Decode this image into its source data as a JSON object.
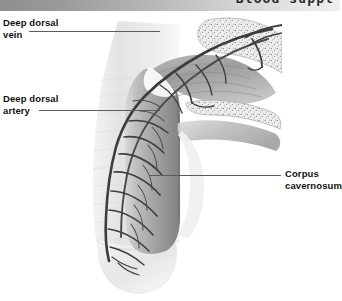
{
  "header": {
    "title": "Blood suppl",
    "bar_gradient_from": "#8e8e8e",
    "bar_gradient_to": "#efefef"
  },
  "figure": {
    "ink_color": "#3a3a3a",
    "tissue_light": "#e9e9e9",
    "tissue_mid": "#c9c9c9",
    "tissue_dark": "#9a9a9a"
  },
  "labels": [
    {
      "id": "deep-dorsal-vein",
      "line1": "Deep dorsal",
      "line2": "vein"
    },
    {
      "id": "deep-dorsal-artery",
      "line1": "Deep dorsal",
      "line2": "artery"
    },
    {
      "id": "corpus-cavernosum",
      "line1": "Corpus",
      "line2": "cavernosum"
    }
  ]
}
